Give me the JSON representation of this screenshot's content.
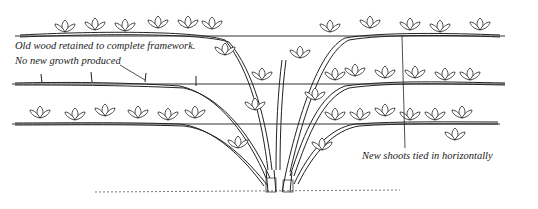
{
  "figure": {
    "type": "botanical-line-illustration",
    "wires_count": 3,
    "colors": {
      "ink": "#222222",
      "background": "#ffffff"
    }
  },
  "annotations": {
    "old_wood_line1": "Old wood retained to complete framework.",
    "old_wood_line2": "No new growth produced",
    "new_shoots": "New shoots tied in horizontally"
  }
}
